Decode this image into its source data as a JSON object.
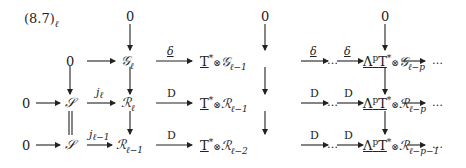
{
  "diagram": {
    "equation_label": "(8.7)",
    "equation_label_sub": "ℓ",
    "top_zeros": [
      "0",
      "0",
      "0"
    ],
    "rows": [
      {
        "name": "G-row",
        "start": "0",
        "nodes": [
          {
            "base": "𝒢",
            "sub": "ℓ"
          },
          {
            "prefix": "T",
            "prefix_sup": "*",
            "otimes": "⊗",
            "base": "𝒢",
            "sub": "ℓ−1"
          },
          {
            "prefix": "Λ",
            "prefix_sup": "p",
            "prefix2": "T",
            "prefix2_sup": "*",
            "otimes": "⊗",
            "base": "𝒢",
            "sub": "ℓ−p"
          }
        ],
        "arrow_labels": [
          "",
          "δ",
          "δ",
          "δ",
          ""
        ],
        "ellipsis": [
          "…",
          "…"
        ]
      },
      {
        "name": "R-row",
        "start": "0",
        "source": "𝒮",
        "nodes": [
          {
            "base": "ℛ",
            "sub": "ℓ"
          },
          {
            "prefix": "T",
            "prefix_sup": "*",
            "otimes": "⊗",
            "base": "ℛ",
            "sub": "ℓ−1"
          },
          {
            "prefix": "Λ",
            "prefix_sup": "p",
            "prefix2": "T",
            "prefix2_sup": "*",
            "otimes": "⊗",
            "base": "ℛ",
            "sub": "ℓ−p"
          }
        ],
        "arrow_labels": [
          "",
          "j",
          "D",
          "D",
          "D",
          ""
        ],
        "j_sub": "ℓ",
        "ellipsis": [
          "…",
          "…"
        ]
      },
      {
        "name": "R-shifted-row",
        "start": "0",
        "source": "𝒮",
        "nodes": [
          {
            "base": "ℛ",
            "sub": "ℓ−1"
          },
          {
            "prefix": "T",
            "prefix_sup": "*",
            "otimes": "⊗",
            "base": "ℛ",
            "sub": "ℓ−2"
          },
          {
            "prefix": "Λ",
            "prefix_sup": "p",
            "prefix2": "T",
            "prefix2_sup": "*",
            "otimes": "⊗",
            "base": "ℛ",
            "sub": "ℓ−p−1"
          }
        ],
        "arrow_labels": [
          "",
          "j",
          "D",
          "D",
          "D",
          ""
        ],
        "j_sub": "ℓ−1",
        "ellipsis": [
          "…",
          "…"
        ]
      }
    ],
    "left_zero": "0"
  }
}
